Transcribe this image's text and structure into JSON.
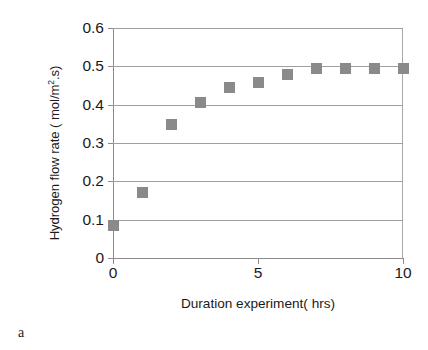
{
  "caption": "a",
  "chart_data": {
    "type": "scatter",
    "title": "",
    "subtitle": "",
    "xlabel": "Duration experiment( hrs)",
    "ylabel": "Hydrogen flow rate ( mol/m2.s)",
    "ylabel_parts": {
      "before": "Hydrogen flow rate ( mol/m",
      "superscript": "2",
      "after": ".s)"
    },
    "xlim": [
      0,
      10
    ],
    "ylim": [
      0,
      0.6
    ],
    "xticks": [
      0,
      5,
      10
    ],
    "xtick_labels": [
      "0",
      "5",
      "10"
    ],
    "yticks": [
      0,
      0.1,
      0.2,
      0.3,
      0.4,
      0.5,
      0.6
    ],
    "ytick_labels": [
      "0",
      "0.1",
      "0.2",
      "0.3",
      "0.4",
      "0.5",
      "0.6"
    ],
    "grid": "horizontal",
    "legend": null,
    "legend_position": "none",
    "marker_shape": "square",
    "marker_color": "#8a8a8a",
    "gridline_color": "#a0a0a0",
    "axis_color": "#8c8c8c",
    "x": [
      0,
      1,
      2,
      3,
      4,
      5,
      6,
      7,
      8,
      9,
      10
    ],
    "values": [
      0.085,
      0.17,
      0.348,
      0.405,
      0.445,
      0.457,
      0.478,
      0.495,
      0.495,
      0.495,
      0.495
    ],
    "points": [
      {
        "x": 0,
        "y": 0.085
      },
      {
        "x": 1,
        "y": 0.17
      },
      {
        "x": 2,
        "y": 0.348
      },
      {
        "x": 3,
        "y": 0.405
      },
      {
        "x": 4,
        "y": 0.445
      },
      {
        "x": 5,
        "y": 0.457
      },
      {
        "x": 6,
        "y": 0.478
      },
      {
        "x": 7,
        "y": 0.495
      },
      {
        "x": 8,
        "y": 0.495
      },
      {
        "x": 9,
        "y": 0.495
      },
      {
        "x": 10,
        "y": 0.495
      }
    ]
  }
}
